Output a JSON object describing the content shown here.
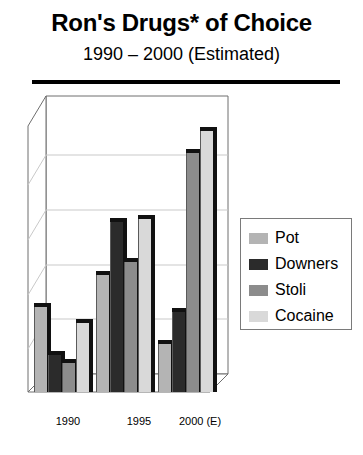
{
  "title": "Ron's Drugs* of Choice",
  "subtitle": "1990 – 2000 (Estimated)",
  "chart_data": {
    "type": "bar",
    "title": "Ron's Drugs* of Choice",
    "subtitle": "1990 – 2000 (Estimated)",
    "xlabel": "",
    "ylabel": "",
    "categories": [
      "1990",
      "1995",
      "2000 (E)"
    ],
    "ylim": [
      0,
      5
    ],
    "grid": true,
    "gridlines": [
      1,
      2,
      3,
      4
    ],
    "axis_tick_labels_visible": false,
    "legend_position": "right",
    "style": "3d-column",
    "series": [
      {
        "name": "Pot",
        "color": "#b4b4b4",
        "values": [
          1.6,
          2.2,
          0.9
        ]
      },
      {
        "name": "Downers",
        "color": "#2b2b2b",
        "values": [
          0.7,
          3.2,
          1.5
        ]
      },
      {
        "name": "Stoli",
        "color": "#8c8c8c",
        "values": [
          0.55,
          2.45,
          4.5
        ]
      },
      {
        "name": "Cocaine",
        "color": "#d9d9d9",
        "values": [
          1.3,
          3.25,
          4.9
        ]
      }
    ]
  },
  "legend": {
    "items": [
      {
        "label": "Pot",
        "color": "#b4b4b4"
      },
      {
        "label": "Downers",
        "color": "#2b2b2b"
      },
      {
        "label": "Stoli",
        "color": "#8c8c8c"
      },
      {
        "label": "Cocaine",
        "color": "#d9d9d9"
      }
    ]
  },
  "xaxis": {
    "labels": [
      "1990",
      "1995",
      "2000 (E)"
    ]
  }
}
